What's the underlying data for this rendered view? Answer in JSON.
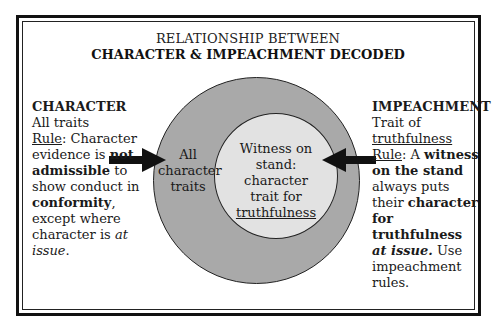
{
  "title": {
    "line1": "RELATIONSHIP BETWEEN",
    "line2": "CHARACTER & IMPEACHMENT DECODED"
  },
  "left_panel": {
    "heading": "CHARACTER",
    "subheading": "All traits",
    "rule_label": "Rule",
    "rule_text_1": ": Character evidence is ",
    "rule_bold_1": "not admissible",
    "rule_text_2": " to show conduct in ",
    "rule_bold_2": "conformity",
    "rule_text_3": ", except where character is ",
    "rule_italic": "at issue",
    "rule_text_4": "."
  },
  "right_panel": {
    "heading": "IMPEACHMENT",
    "subheading_1": "Trait of",
    "subheading_underlined": "truthfulness",
    "rule_label": "Rule",
    "rule_text_1": ": A ",
    "rule_bold_1": "witness on the stand",
    "rule_text_2": " always puts their ",
    "rule_bold_2": "character for truthfulness",
    "rule_bold_italic": "at issue.",
    "rule_text_3": " Use impeachment rules."
  },
  "diagram": {
    "outer_circle_label": [
      "All",
      "character",
      "traits"
    ],
    "inner_circle_label": [
      "Witness on",
      "stand:",
      "character",
      "trait for"
    ],
    "inner_circle_underlined": "truthfulness",
    "colors": {
      "outer_circle": "#a9a9a9",
      "inner_circle": "#e2e2e2",
      "arrow": "#111111"
    }
  }
}
